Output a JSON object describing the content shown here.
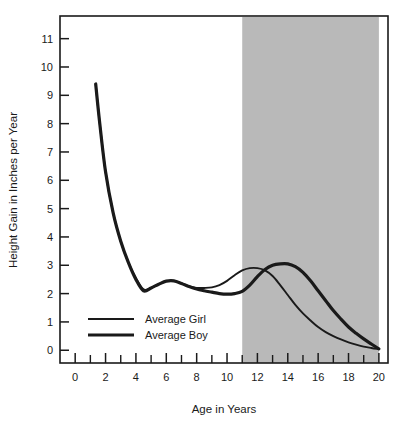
{
  "chart_data": {
    "type": "line",
    "title": "",
    "xlabel": "Age in Years",
    "ylabel": "Height Gain in Inches per Year",
    "xlim": [
      -1,
      20.6
    ],
    "ylim": [
      -0.45,
      11.8
    ],
    "grid": false,
    "legend_position": "inside-lower-left",
    "xticks_major": [
      0,
      2,
      4,
      6,
      8,
      10,
      12,
      14,
      16,
      18,
      20
    ],
    "xticks_minor": [
      1,
      3,
      5,
      7,
      9,
      11,
      13,
      15,
      17,
      19
    ],
    "xtick_labels": [
      "0",
      "2",
      "4",
      "6",
      "8",
      "10",
      "12",
      "14",
      "16",
      "18",
      "20"
    ],
    "yticks": [
      0,
      1,
      2,
      3,
      4,
      5,
      6,
      7,
      8,
      9,
      10,
      11
    ],
    "ytick_labels": [
      "0",
      "1",
      "2",
      "3",
      "4",
      "5",
      "6",
      "7",
      "8",
      "9",
      "10",
      "11"
    ],
    "shaded_band": {
      "label": "",
      "x_start": 11,
      "x_end": 20,
      "color": "#b9b9b9"
    },
    "series": [
      {
        "name": "Average Girl",
        "color": "#1a1a1a",
        "line_width": 1.9,
        "x": [
          1.35,
          1.6,
          2.0,
          2.5,
          3.0,
          3.5,
          4.0,
          4.5,
          5.0,
          5.5,
          6.0,
          6.5,
          7.0,
          7.5,
          8.0,
          8.5,
          9.0,
          9.5,
          10.0,
          10.5,
          11.0,
          11.5,
          12.0,
          12.5,
          13.0,
          13.5,
          14.0,
          14.5,
          15.0,
          15.5,
          16.0,
          16.5,
          17.0,
          17.5,
          18.0,
          18.5,
          19.0,
          19.5,
          20.0
        ],
        "y": [
          9.4,
          8.1,
          6.3,
          4.85,
          3.85,
          3.1,
          2.55,
          2.15,
          2.2,
          2.33,
          2.44,
          2.45,
          2.36,
          2.25,
          2.2,
          2.2,
          2.22,
          2.3,
          2.45,
          2.65,
          2.82,
          2.9,
          2.9,
          2.82,
          2.62,
          2.3,
          1.95,
          1.6,
          1.3,
          1.05,
          0.82,
          0.64,
          0.5,
          0.38,
          0.28,
          0.2,
          0.13,
          0.08,
          0.04
        ]
      },
      {
        "name": "Average Boy",
        "color": "#1a1a1a",
        "line_width": 3.2,
        "x": [
          1.35,
          1.6,
          2.0,
          2.5,
          3.0,
          3.5,
          4.0,
          4.5,
          5.0,
          5.5,
          6.0,
          6.5,
          7.0,
          7.5,
          8.0,
          8.5,
          9.0,
          9.5,
          10.0,
          10.5,
          11.0,
          11.5,
          12.0,
          12.5,
          13.0,
          13.5,
          14.0,
          14.5,
          15.0,
          15.5,
          16.0,
          16.5,
          17.0,
          17.5,
          18.0,
          18.5,
          19.0,
          19.5,
          20.0
        ],
        "y": [
          9.4,
          8.1,
          6.3,
          4.85,
          3.85,
          3.1,
          2.5,
          2.1,
          2.2,
          2.33,
          2.44,
          2.45,
          2.36,
          2.25,
          2.16,
          2.1,
          2.05,
          2.0,
          1.98,
          2.0,
          2.08,
          2.3,
          2.6,
          2.85,
          3.0,
          3.05,
          3.05,
          2.95,
          2.75,
          2.45,
          2.1,
          1.75,
          1.4,
          1.1,
          0.82,
          0.6,
          0.4,
          0.22,
          0.05
        ]
      }
    ],
    "legend": [
      {
        "label": "Average Girl",
        "line_width": 1.9,
        "color": "#1a1a1a"
      },
      {
        "label": "Average Boy",
        "line_width": 3.2,
        "color": "#1a1a1a"
      }
    ]
  },
  "frame": {
    "border_color": "#1a1a1a"
  }
}
